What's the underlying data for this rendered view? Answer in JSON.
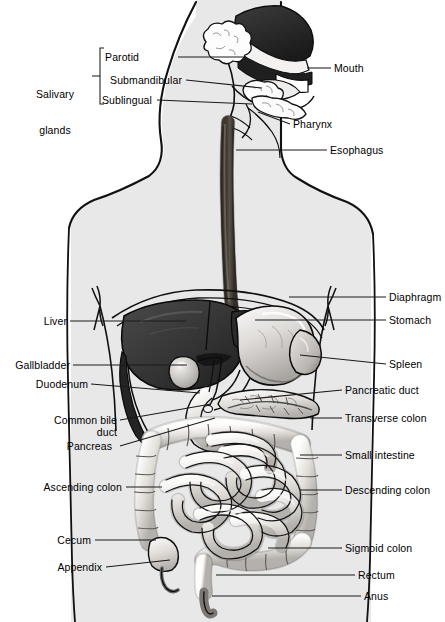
{
  "figure": {
    "type": "anatomical-illustration",
    "style": "grayscale line art with shaded body silhouette",
    "colors": {
      "background": "#ffffff",
      "body_silhouette": "#e8e8e8",
      "outline": "#000000",
      "liver_dark": "#3a3a3a",
      "nasal_dark": "#2e2e2e",
      "esophagus": "#5a5149",
      "organ_light": "#f2f0ee",
      "organ_mid": "#c9c6c2",
      "leader_line": "#1a1a1a"
    }
  },
  "group_label": {
    "name": "salivary-glands",
    "line1": "Salivary",
    "line2": "glands",
    "members": [
      "Parotid",
      "Submandibular",
      "Sublingual"
    ]
  },
  "labels_left": [
    {
      "id": "parotid",
      "text": "Parotid",
      "x": 139,
      "y": 57,
      "lead_to_x": 243,
      "lead_to_y": 57
    },
    {
      "id": "submandibular",
      "text": "Submandibular",
      "x": 182,
      "y": 80,
      "lead_to_x": 262,
      "lead_to_y": 88
    },
    {
      "id": "sublingual",
      "text": "Sublingual",
      "x": 152,
      "y": 100,
      "lead_to_x": 252,
      "lead_to_y": 104
    },
    {
      "id": "liver",
      "text": "Liver",
      "x": 67,
      "y": 321,
      "lead_to_x": 186,
      "lead_to_y": 321
    },
    {
      "id": "gallbladder",
      "text": "Gallbladder",
      "x": 70,
      "y": 365,
      "lead_to_x": 187,
      "lead_to_y": 365
    },
    {
      "id": "duodenum",
      "text": "Duodenum",
      "x": 88,
      "y": 384,
      "lead_to_x": 200,
      "lead_to_y": 393
    },
    {
      "id": "common-bile-duct",
      "text": "Common bile",
      "x": 117,
      "y": 420,
      "lead_to_x": 211,
      "lead_to_y": 404
    },
    {
      "id": "common-bile-duct-2",
      "text": "duct",
      "x": 117,
      "y": 432,
      "lead_to_x": 0,
      "lead_to_y": 0
    },
    {
      "id": "pancreas",
      "text": "Pancreas",
      "x": 113,
      "y": 446,
      "lead_to_x": 215,
      "lead_to_y": 418
    },
    {
      "id": "ascending-colon",
      "text": "Ascending colon",
      "x": 123,
      "y": 487,
      "lead_to_x": 162,
      "lead_to_y": 487
    },
    {
      "id": "cecum",
      "text": "Cecum",
      "x": 92,
      "y": 540,
      "lead_to_x": 156,
      "lead_to_y": 540
    },
    {
      "id": "appendix",
      "text": "Appendix",
      "x": 103,
      "y": 567,
      "lead_to_x": 170,
      "lead_to_y": 560
    }
  ],
  "labels_right": [
    {
      "id": "mouth",
      "text": "Mouth",
      "x": 334,
      "y": 68,
      "lead_to_x": 307,
      "lead_to_y": 68
    },
    {
      "id": "pharynx",
      "text": "Pharynx",
      "x": 293,
      "y": 124,
      "lead_to_x": 258,
      "lead_to_y": 112
    },
    {
      "id": "esophagus",
      "text": "Esophagus",
      "x": 330,
      "y": 150,
      "lead_to_x": 236,
      "lead_to_y": 150
    },
    {
      "id": "diaphragm",
      "text": "Diaphragm",
      "x": 389,
      "y": 297,
      "lead_to_x": 289,
      "lead_to_y": 297
    },
    {
      "id": "stomach",
      "text": "Stomach",
      "x": 389,
      "y": 320,
      "lead_to_x": 255,
      "lead_to_y": 320
    },
    {
      "id": "spleen",
      "text": "Spleen",
      "x": 389,
      "y": 364,
      "lead_to_x": 300,
      "lead_to_y": 355
    },
    {
      "id": "pancreatic-duct",
      "text": "Pancreatic duct",
      "x": 345,
      "y": 390,
      "lead_to_x": 240,
      "lead_to_y": 400
    },
    {
      "id": "transverse-colon",
      "text": "Transverse colon",
      "x": 345,
      "y": 418,
      "lead_to_x": 310,
      "lead_to_y": 418
    },
    {
      "id": "small-intestine",
      "text": "Small intestine",
      "x": 345,
      "y": 455,
      "lead_to_x": 300,
      "lead_to_y": 455
    },
    {
      "id": "descending-colon",
      "text": "Descending colon",
      "x": 345,
      "y": 490,
      "lead_to_x": 300,
      "lead_to_y": 490
    },
    {
      "id": "sigmoid-colon",
      "text": "Sigmoid colon",
      "x": 345,
      "y": 548,
      "lead_to_x": 268,
      "lead_to_y": 548
    },
    {
      "id": "rectum",
      "text": "Rectum",
      "x": 358,
      "y": 575,
      "lead_to_x": 216,
      "lead_to_y": 575
    },
    {
      "id": "anus",
      "text": "Anus",
      "x": 364,
      "y": 596,
      "lead_to_x": 212,
      "lead_to_y": 596
    }
  ]
}
